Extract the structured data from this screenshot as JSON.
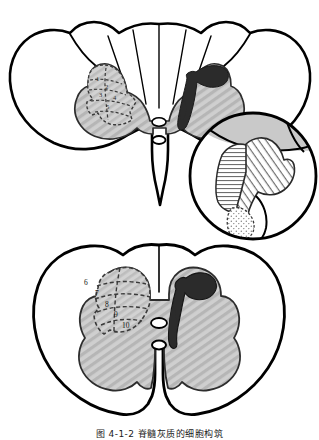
{
  "figure": {
    "caption": "图 4-1-2  脊髓灰质的细胞构筑",
    "caption_clipped": true,
    "background_color": "#ffffff",
    "outline_color": "#000000",
    "gray_matter_fill": "#c9c9c9",
    "hatch_line_color": "#9a9a9a",
    "lesion_fill": "#2b2b2b",
    "lamina_dash_color": "#3a3a3a",
    "white_matter_fill": "#ffffff"
  },
  "panels": [
    {
      "id": "upper-section",
      "name": "cervical-cord-section",
      "label": "Upper spinal cord cross-section",
      "shape": "wide oval with prominent lateral funiculi",
      "features": {
        "dorsal_columns": "fasciculus gracilis and cuneatus separated by septa",
        "central_canal": "small oval at center",
        "ventral_median_fissure": "deep midline cleft",
        "lamina_region_side": "left",
        "lesion_side": "right",
        "lesion_shape": "irregular hook / comma-shaped dark band in lateral funiculus"
      },
      "lamina_numbers": [
        "1",
        "2",
        "3",
        "4",
        "5"
      ]
    },
    {
      "id": "lower-section",
      "name": "lumbar-cord-section",
      "label": "Lower spinal cord cross-section",
      "shape": "rounded oval with bulky ventral horns",
      "features": {
        "central_canal": "small oval at center",
        "ventral_median_fissure": "deep midline cleft",
        "lamina_region_side": "left",
        "lesion_side": "right",
        "lesion_shape": "thick S-shaped dark band in lateral funiculus"
      },
      "lamina_numbers": [
        "6",
        "7",
        "8",
        "9",
        "10"
      ]
    }
  ],
  "inset": {
    "id": "magnifier-inset",
    "name": "magnified-detail-circle",
    "label": "Circular magnified detail of dorsal horn laminae",
    "overlaps": "lower-right of upper-section",
    "textures": [
      {
        "name": "horizontal-hatch",
        "description": "closely spaced horizontal lines"
      },
      {
        "name": "diagonal-hatch",
        "description": "closely spaced diagonal lines"
      },
      {
        "name": "stipple",
        "description": "fine dotted stippling"
      }
    ]
  },
  "lamina_labels_lower": [
    {
      "number": "6",
      "x": 86,
      "y": 283
    },
    {
      "number": "7",
      "x": 97,
      "y": 294
    },
    {
      "number": "8",
      "x": 107,
      "y": 305
    },
    {
      "number": "9",
      "x": 115,
      "y": 315
    },
    {
      "number": "10",
      "x": 124,
      "y": 325
    }
  ],
  "lamina_labels_upper": [
    {
      "number": "1",
      "x": 96,
      "y": 80
    },
    {
      "number": "2",
      "x": 104,
      "y": 88
    },
    {
      "number": "3",
      "x": 100,
      "y": 96
    },
    {
      "number": "4",
      "x": 112,
      "y": 99
    },
    {
      "number": "5",
      "x": 106,
      "y": 108
    }
  ]
}
